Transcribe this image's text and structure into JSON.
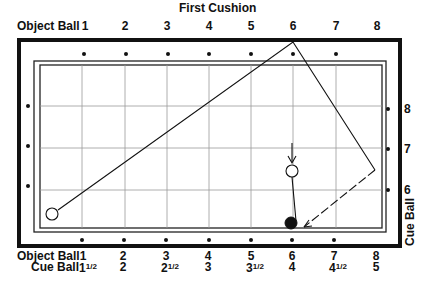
{
  "title": "First Cushion",
  "top_axis": {
    "label": "Object Ball",
    "numbers": [
      "1",
      "2",
      "3",
      "4",
      "5",
      "6",
      "7",
      "8"
    ]
  },
  "bottom_axis": {
    "object_ball_label": "Object Ball",
    "object_ball_numbers": [
      "1",
      "2",
      "3",
      "4",
      "5",
      "6",
      "7",
      "8"
    ],
    "cue_ball_label": "Cue Ball",
    "cue_ball_numbers": [
      {
        "whole": "1",
        "frac": "1/2"
      },
      {
        "whole": "2",
        "frac": ""
      },
      {
        "whole": "2",
        "frac": "1/2"
      },
      {
        "whole": "3",
        "frac": ""
      },
      {
        "whole": "3",
        "frac": "1/2"
      },
      {
        "whole": "4",
        "frac": ""
      },
      {
        "whole": "4",
        "frac": "1/2"
      },
      {
        "whole": "5",
        "frac": ""
      }
    ]
  },
  "right_axis": {
    "label": "Cue Ball",
    "numbers": [
      "8",
      "7",
      "6"
    ]
  },
  "table": {
    "frame_color": "#111111",
    "cloth_color": "#ffffff",
    "grid_color": "#9a9a9a",
    "balls": {
      "cue_ball": {
        "x": 52,
        "y": 214,
        "fill": "#ffffff"
      },
      "object_ball_white": {
        "x": 292,
        "y": 171,
        "fill": "#ffffff"
      },
      "object_ball_black": {
        "x": 291,
        "y": 223,
        "fill": "#111111"
      }
    },
    "path": {
      "main": [
        [
          52,
          214
        ],
        [
          293,
          42
        ],
        [
          375,
          170
        ]
      ],
      "dashed_return": [
        [
          375,
          170
        ],
        [
          302,
          228
        ]
      ],
      "object_ball_line": [
        [
          292,
          178
        ],
        [
          297,
          222
        ]
      ],
      "arrow_in": [
        [
          292,
          145
        ],
        [
          292,
          163
        ]
      ]
    }
  }
}
